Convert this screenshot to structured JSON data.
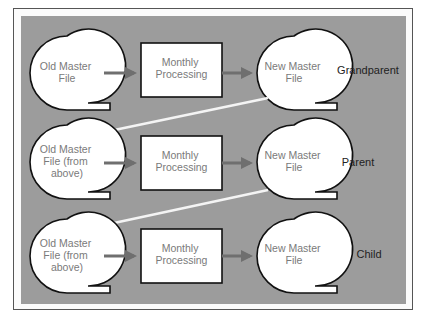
{
  "diagram": {
    "colors": {
      "panel_background": "#9c9c9c",
      "node_fill": "#ffffff",
      "node_stroke": "#111111",
      "flow_arrow": "#6f6f6f",
      "carry_arrow": "#f4f4f4",
      "node_text": "#7a7a7a",
      "label_text": "#222222"
    },
    "rows": [
      {
        "generation_label": "Grandparent",
        "input_file": [
          "Old Master",
          "File"
        ],
        "process": [
          "Monthly",
          "Processing"
        ],
        "output_file": [
          "New Master",
          "File"
        ]
      },
      {
        "generation_label": "Parent",
        "input_file": [
          "Old Master",
          "File (from",
          "above)"
        ],
        "process": [
          "Monthly",
          "Processing"
        ],
        "output_file": [
          "New Master",
          "File"
        ]
      },
      {
        "generation_label": "Child",
        "input_file": [
          "Old Master",
          "File (from",
          "above)"
        ],
        "process": [
          "Monthly",
          "Processing"
        ],
        "output_file": [
          "New Master",
          "File"
        ]
      }
    ]
  }
}
